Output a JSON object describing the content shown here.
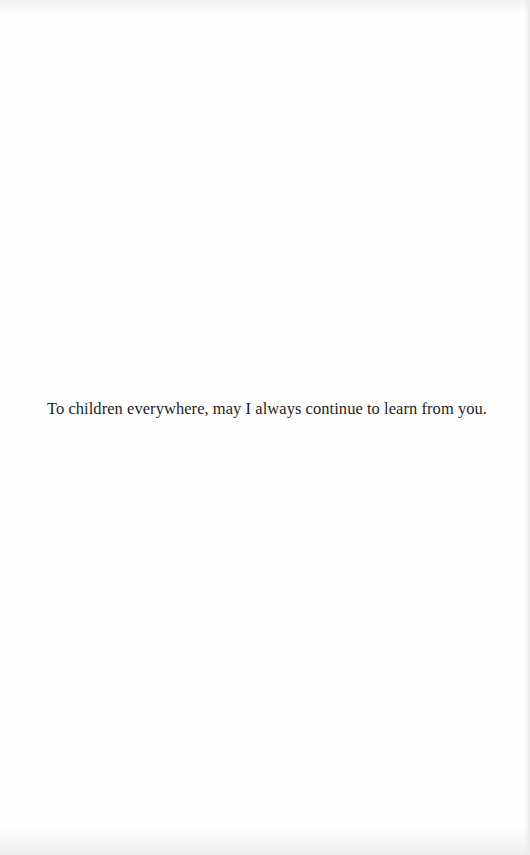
{
  "page": {
    "type": "dedication",
    "text": "To children everywhere, may I always continue to learn from you.",
    "colors": {
      "background": "#fefefe",
      "text": "#1e1e1e"
    }
  }
}
